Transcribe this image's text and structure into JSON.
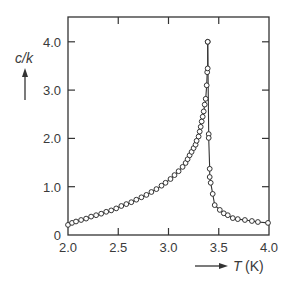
{
  "chart_data": {
    "type": "line",
    "title": "",
    "xlabel": "T (K)",
    "ylabel": "c/k",
    "xlim": [
      2.0,
      4.0
    ],
    "ylim": [
      0,
      4.5
    ],
    "xticks": [
      2.0,
      2.5,
      3.0,
      3.5,
      4.0
    ],
    "xtick_labels": [
      "2.0",
      "2.5",
      "3.0",
      "3.5",
      "4.0"
    ],
    "yticks": [
      0,
      1.0,
      2.0,
      3.0,
      4.0
    ],
    "ytick_labels": [
      "0",
      "1.0",
      "2.0",
      "3.0",
      "4.0"
    ],
    "grid": false,
    "legend": null,
    "markers": "open-circle",
    "series": [
      {
        "name": "below transition (T < 3.39 K)",
        "x": [
          2.0,
          2.04,
          2.08,
          2.13,
          2.18,
          2.23,
          2.28,
          2.33,
          2.38,
          2.43,
          2.48,
          2.53,
          2.58,
          2.63,
          2.68,
          2.73,
          2.78,
          2.83,
          2.88,
          2.93,
          2.97,
          3.02,
          3.06,
          3.1,
          3.14,
          3.17,
          3.19,
          3.21,
          3.23,
          3.25,
          3.27,
          3.28,
          3.3,
          3.31,
          3.32,
          3.33,
          3.34,
          3.35,
          3.36,
          3.37,
          3.38,
          3.385,
          3.39,
          3.39
        ],
        "y": [
          0.21,
          0.25,
          0.28,
          0.31,
          0.34,
          0.38,
          0.41,
          0.44,
          0.48,
          0.51,
          0.55,
          0.6,
          0.64,
          0.68,
          0.73,
          0.78,
          0.83,
          0.89,
          0.95,
          1.02,
          1.08,
          1.16,
          1.24,
          1.32,
          1.41,
          1.49,
          1.57,
          1.65,
          1.72,
          1.8,
          1.87,
          1.95,
          2.04,
          2.14,
          2.24,
          2.35,
          2.45,
          2.56,
          2.7,
          2.82,
          3.1,
          3.37,
          3.45,
          4.0
        ]
      },
      {
        "name": "above transition (T > 3.39 K)",
        "x": [
          3.39,
          3.4,
          3.4,
          3.41,
          3.41,
          3.42,
          3.44,
          3.46,
          3.51,
          3.55,
          3.59,
          3.64,
          3.69,
          3.76,
          3.83,
          3.89,
          3.99
        ],
        "y": [
          4.0,
          2.09,
          2.01,
          1.37,
          1.2,
          1.08,
          0.85,
          0.62,
          0.52,
          0.45,
          0.41,
          0.35,
          0.33,
          0.31,
          0.29,
          0.27,
          0.25
        ]
      }
    ]
  },
  "labels": {
    "y_axis_title": "c/k",
    "x_axis_title_var": "T",
    "x_axis_title_unit": "(K)"
  }
}
